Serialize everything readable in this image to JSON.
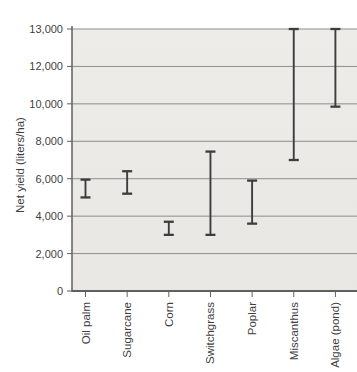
{
  "chart_data": {
    "type": "range-bar",
    "title": "",
    "xlabel": "",
    "ylabel": "Net yield (liters/ha)",
    "categories": [
      "Oil palm",
      "Sugarcane",
      "Corn",
      "Switchgrass",
      "Poplar",
      "Miscanthus",
      "Algae (pond)"
    ],
    "series": [
      {
        "name": "net-yield-range",
        "ranges": [
          {
            "category": "Oil palm",
            "low": 5000,
            "high": 5950
          },
          {
            "category": "Sugarcane",
            "low": 5200,
            "high": 6400
          },
          {
            "category": "Corn",
            "low": 3000,
            "high": 3700
          },
          {
            "category": "Switchgrass",
            "low": 3000,
            "high": 7450
          },
          {
            "category": "Poplar",
            "low": 3600,
            "high": 5900
          },
          {
            "category": "Miscanthus",
            "low": 7000,
            "high": 13000
          },
          {
            "category": "Algae (pond)",
            "low": 9850,
            "high": 13000
          }
        ]
      }
    ],
    "y_ticks": [
      {
        "value": 0,
        "label": "0"
      },
      {
        "value": 2000,
        "label": "2,000"
      },
      {
        "value": 4000,
        "label": "4,000"
      },
      {
        "value": 6000,
        "label": "6,000"
      },
      {
        "value": 8000,
        "label": "8,000"
      },
      {
        "value": 10000,
        "label": "10,000"
      },
      {
        "value": 12000,
        "label": "12,000"
      },
      {
        "value": 13000,
        "label": "13,000"
      }
    ],
    "axis_note": "y-axis gridlines equally spaced; top interval 12,000-13,000 is compressed to one gridline step",
    "grid": true,
    "legend": false
  },
  "colors": {
    "page_background": "#ffffff",
    "plot_background": "#edece9",
    "plot_background_bottom": "#e9e7e3",
    "grid_line": "#8d8d8d",
    "axis_line": "#5f5f5f",
    "bar": "#3d3d3d",
    "text": "#3f3f3f"
  }
}
